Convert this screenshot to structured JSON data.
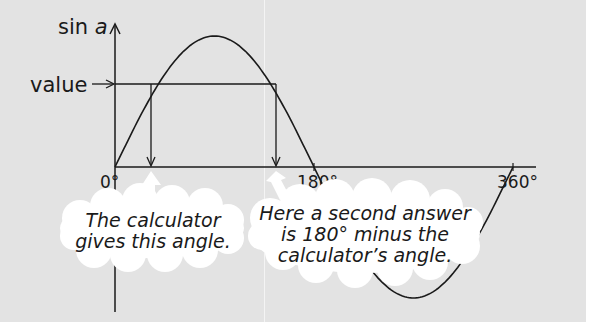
{
  "diagram": {
    "y_axis_label_prefix": "sin ",
    "y_axis_label_var": "a",
    "value_label": "value",
    "x_ticks": [
      {
        "label": "0°",
        "deg": 0
      },
      {
        "label": "180°",
        "deg": 180
      },
      {
        "label": "360°",
        "deg": 360
      }
    ],
    "bubbles": [
      {
        "lines": [
          "The calculator",
          "gives this angle."
        ]
      },
      {
        "lines": [
          "Here a second answer",
          "is 180° minus the",
          "calculator’s angle."
        ]
      }
    ],
    "colors": {
      "background": "#e3e3e3",
      "ink": "#1a1a1a",
      "bubble": "#ffffff"
    }
  },
  "chart_data": {
    "type": "line",
    "title": "",
    "xlabel": "a",
    "ylabel": "sin a",
    "series": [
      {
        "name": "sin a",
        "x": [
          0,
          45,
          90,
          135,
          180,
          225,
          270,
          315,
          360
        ],
        "values": [
          0,
          0.707,
          1,
          0.707,
          0,
          -0.707,
          -1,
          -0.707,
          0
        ]
      }
    ],
    "annotations": [
      "value",
      "The calculator gives this angle.",
      "Here a second answer is 180° minus the calculator’s angle."
    ],
    "x_tick_labels": [
      "0°",
      "180°",
      "360°"
    ],
    "xlim": [
      0,
      360
    ],
    "ylim": [
      -1,
      1
    ],
    "grid": false
  }
}
